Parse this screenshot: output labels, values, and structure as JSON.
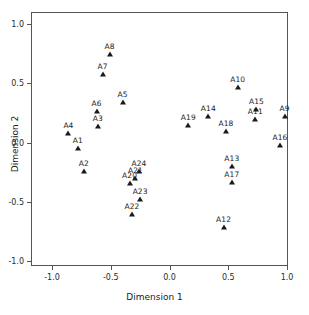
{
  "chart_data": {
    "type": "scatter",
    "title": "",
    "xlabel": "Dimension 1",
    "ylabel": "Dimension 2",
    "xlim": [
      -1.15,
      1.15
    ],
    "ylim": [
      -1.15,
      1.15
    ],
    "xticks": [
      -1.0,
      -0.5,
      0.0,
      0.5,
      1.0
    ],
    "xticklabels": [
      "-1.0",
      "-0.5",
      "0.0",
      "0.5",
      "1.0"
    ],
    "yticks": [
      -1.0,
      -0.5,
      0.0,
      0.5,
      1.0
    ],
    "yticklabels": [
      "-1.0",
      "-0.5",
      "0.0",
      "0.5",
      "1.0"
    ],
    "grid": false,
    "legend": false,
    "marker": "filled-triangle",
    "marker_color": "#1a1a1a",
    "label_position": "above",
    "points": [
      {
        "label": "A1",
        "x": -0.78,
        "y": -0.05
      },
      {
        "label": "A2",
        "x": -0.73,
        "y": -0.24
      },
      {
        "label": "A3",
        "x": -0.61,
        "y": 0.14
      },
      {
        "label": "A4",
        "x": -0.86,
        "y": 0.08
      },
      {
        "label": "A5",
        "x": -0.4,
        "y": 0.34
      },
      {
        "label": "A6",
        "x": -0.62,
        "y": 0.27
      },
      {
        "label": "A7",
        "x": -0.57,
        "y": 0.58
      },
      {
        "label": "A8",
        "x": -0.51,
        "y": 0.75
      },
      {
        "label": "A9",
        "x": 0.98,
        "y": 0.22
      },
      {
        "label": "A10",
        "x": 0.58,
        "y": 0.47
      },
      {
        "label": "A11",
        "x": 0.73,
        "y": 0.2
      },
      {
        "label": "A12",
        "x": 0.46,
        "y": -0.71
      },
      {
        "label": "A13",
        "x": 0.53,
        "y": -0.2
      },
      {
        "label": "A14",
        "x": 0.33,
        "y": 0.22
      },
      {
        "label": "A15",
        "x": 0.74,
        "y": 0.28
      },
      {
        "label": "A16",
        "x": 0.94,
        "y": -0.02
      },
      {
        "label": "A17",
        "x": 0.53,
        "y": -0.33
      },
      {
        "label": "A18",
        "x": 0.48,
        "y": 0.1
      },
      {
        "label": "A19",
        "x": 0.16,
        "y": 0.15
      },
      {
        "label": "A20",
        "x": -0.34,
        "y": -0.34
      },
      {
        "label": "A21",
        "x": -0.29,
        "y": -0.3
      },
      {
        "label": "A22",
        "x": -0.32,
        "y": -0.6
      },
      {
        "label": "A23",
        "x": -0.25,
        "y": -0.48
      },
      {
        "label": "A24",
        "x": -0.26,
        "y": -0.24
      }
    ]
  },
  "axes": {
    "xlabel": "Dimension 1",
    "ylabel": "Dimension 2"
  }
}
